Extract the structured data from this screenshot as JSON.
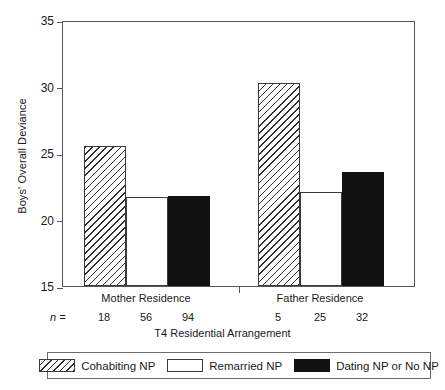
{
  "chart_data": {
    "type": "bar",
    "title": "",
    "xlabel": "T4 Residential Arrangement",
    "ylabel": "Boys' Overall Deviance",
    "ylim": [
      15,
      35
    ],
    "yticks": [
      15,
      20,
      25,
      30,
      35
    ],
    "grid": false,
    "legend_position": "bottom",
    "categories": [
      "Mother Residence",
      "Father Residence"
    ],
    "series": [
      {
        "name": "Cohabiting NP",
        "values": [
          25.5,
          30.3
        ],
        "fill": "hatch"
      },
      {
        "name": "Remarried NP",
        "values": [
          21.7,
          22.1
        ],
        "fill": "white"
      },
      {
        "name": "Dating NP or No NP",
        "values": [
          21.8,
          23.6
        ],
        "fill": "black"
      }
    ],
    "n_label": "n =",
    "n_values": [
      {
        "group": "Mother Residence",
        "counts": [
          18,
          56,
          94
        ]
      },
      {
        "group": "Father Residence",
        "counts": [
          5,
          25,
          32
        ]
      }
    ],
    "colors": {
      "axis": "#55555a",
      "bar_outline": "#3a3a3a",
      "black_fill": "#111111",
      "white_fill": "#ffffff",
      "hatch_stroke": "#2e2e2e"
    }
  },
  "axis": {
    "y_title": "Boys' Overall Deviance",
    "x_title": "T4 Residential Arrangement",
    "y_tick_labels": [
      "35",
      "30",
      "25",
      "20",
      "15"
    ]
  },
  "groups": [
    {
      "label": "Mother Residence",
      "n": [
        "18",
        "56",
        "94"
      ]
    },
    {
      "label": "Father Residence",
      "n": [
        "5",
        "25",
        "32"
      ]
    }
  ],
  "n_prefix": "n =",
  "legend": {
    "entries": [
      {
        "label": "Cohabiting NP",
        "swatch": "hatched-rectangle-swatch"
      },
      {
        "label": "Remarried NP",
        "swatch": "white-rectangle-swatch"
      },
      {
        "label": "Dating NP or No NP",
        "swatch": "black-rectangle-swatch"
      }
    ]
  }
}
